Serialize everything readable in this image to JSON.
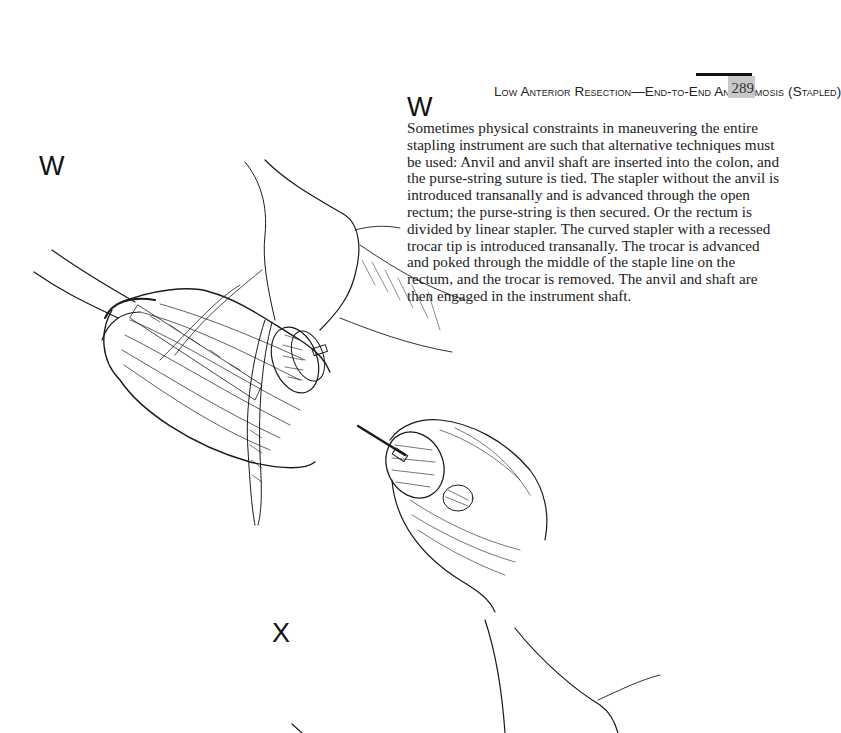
{
  "page": {
    "running_head": "Low Anterior Resection—End-to-End Anastomosis (Stapled)",
    "page_number": "289"
  },
  "section": {
    "label": "W",
    "body": "Sometimes physical constraints in maneuvering the entire stapling instrument are such that alternative techniques must be used: Anvil and anvil shaft are inserted into the colon, and the purse-string suture is tied. The stapler without the anvil is introduced transanally and is advanced through the open rectum; the purse-string is then secured. Or the rectum is divided by linear stapler. The curved stapler with a recessed trocar tip is introduced transanally. The trocar is advanced and poked through the middle of the staple line on the rectum, and the trocar is removed. The anvil and shaft are then engaged in the instrument shaft."
  },
  "figure": {
    "label_w": "W",
    "label_x": "X",
    "panels": [
      {
        "label": "W",
        "depicts": "anvil and anvil shaft within colon, purse-string suture tied"
      },
      {
        "label": "X",
        "depicts": "curved stapler with trocar introduced through rectal staple line"
      }
    ]
  },
  "colors": {
    "ink": "#1a1a1a",
    "page_background": "#ffffff",
    "page_number_tab": "#c8c8c8"
  }
}
